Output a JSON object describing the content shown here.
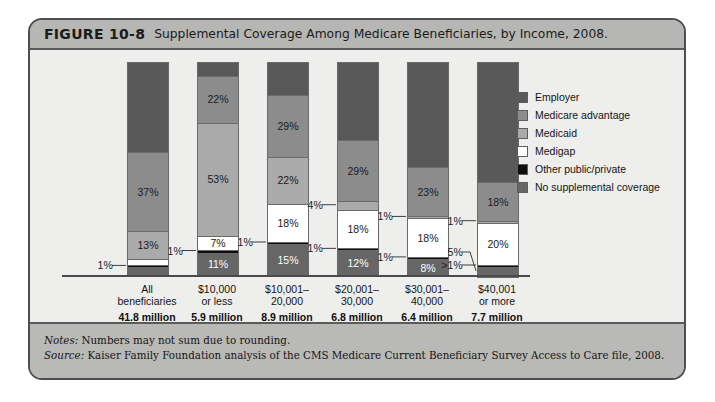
{
  "figure": {
    "number": "FIGURE 10-8",
    "title": "Supplemental Coverage Among Medicare Beneficiaries, by Income, 2008."
  },
  "notes": {
    "notes_key": "Notes:",
    "notes_text": " Numbers may not sum due to rounding.",
    "source_key": "Source:",
    "source_text": " Kaiser Family Foundation analysis of the CMS Medicare Current Beneficiary Survey Access to Care file, 2008."
  },
  "legend": {
    "position": "right",
    "items": [
      {
        "label": "Employer",
        "color": "#595959"
      },
      {
        "label": "Medicare advantage",
        "color": "#8c8c8c"
      },
      {
        "label": "Medicaid",
        "color": "#aaaaaa"
      },
      {
        "label": "Medigap",
        "color": "#ffffff"
      },
      {
        "label": "Other public/private",
        "color": "#0d0d0d"
      },
      {
        "label": "No supplemental coverage",
        "color": "#666666"
      }
    ]
  },
  "chart_data": {
    "type": "bar",
    "subtype": "stacked-100-percent",
    "title": "Supplemental Coverage Among Medicare Beneficiaries, by Income, 2008.",
    "xlabel": "",
    "ylabel": "",
    "ylim": [
      0,
      100
    ],
    "grid": false,
    "legend_position": "right",
    "categories": [
      "All beneficiaries",
      "$10,000 or less",
      "$10,001–20,000",
      "$20,001–30,000",
      "$30,001–40,000",
      "$40,001 or more"
    ],
    "category_lines": [
      [
        "All",
        "beneficiaries"
      ],
      [
        "$10,000",
        "or less"
      ],
      [
        "$10,001–",
        "20,000"
      ],
      [
        "$20,001–",
        "30,000"
      ],
      [
        "$30,001–",
        "40,000"
      ],
      [
        "$40,001",
        "or more"
      ]
    ],
    "category_counts": [
      "41.8 million",
      "5.9 million",
      "8.9 million",
      "6.8 million",
      "6.4 million",
      "7.7 million"
    ],
    "series": [
      {
        "name": "Employer",
        "color": "#595959",
        "values": [
          42,
          6,
          15,
          36,
          49,
          56
        ],
        "labels": [
          "",
          "",
          "",
          "",
          "",
          ""
        ]
      },
      {
        "name": "Medicare advantage",
        "color": "#8c8c8c",
        "values": [
          37,
          22,
          29,
          29,
          23,
          18
        ],
        "labels": [
          "37%",
          "22%",
          "29%",
          "29%",
          "23%",
          "18%"
        ]
      },
      {
        "name": "Medicaid",
        "color": "#aaaaaa",
        "values": [
          13,
          53,
          22,
          4,
          1,
          1
        ],
        "labels": [
          "13%",
          "53%",
          "22%",
          "4%",
          "1%",
          "1%"
        ]
      },
      {
        "name": "Medigap",
        "color": "#ffffff",
        "values": [
          3,
          7,
          18,
          18,
          18,
          20
        ],
        "labels": [
          "3%",
          "7%",
          "18%",
          "18%",
          "18%",
          "20%"
        ]
      },
      {
        "name": "Other public/private",
        "color": "#0d0d0d",
        "values": [
          1,
          1,
          1,
          1,
          1,
          0.6
        ],
        "labels": [
          "1%",
          "1%",
          "1%",
          "1%",
          "1%",
          ">1%"
        ]
      },
      {
        "name": "No supplemental coverage",
        "color": "#666666",
        "values": [
          4,
          11,
          15,
          12,
          8,
          5
        ],
        "labels": [
          "4%",
          "11%",
          "15%",
          "12%",
          "8%",
          "5%"
        ]
      }
    ],
    "callouts": [
      {
        "text": "1%",
        "bar": 0,
        "series": "Other public/private"
      },
      {
        "text": "1%",
        "bar": 1,
        "series": "Other public/private"
      },
      {
        "text": "1%",
        "bar": 2,
        "series": "Other public/private"
      },
      {
        "text": "4%",
        "bar": 3,
        "series": "Medicaid"
      },
      {
        "text": "1%",
        "bar": 3,
        "series": "Other public/private"
      },
      {
        "text": "1%",
        "bar": 4,
        "series": "Medicaid"
      },
      {
        "text": "1%",
        "bar": 4,
        "series": "Other public/private"
      },
      {
        "text": "1%",
        "bar": 5,
        "series": "Medicaid"
      },
      {
        "text": ">1%",
        "bar": 5,
        "series": "Other public/private"
      },
      {
        "text": "5%",
        "bar": 5,
        "series": "No supplemental coverage"
      }
    ]
  }
}
